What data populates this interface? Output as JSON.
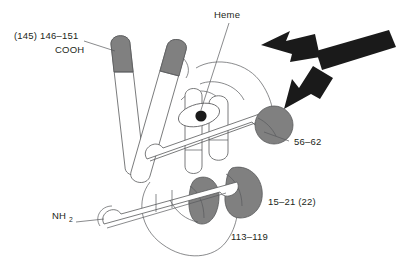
{
  "figure": {
    "kind": "protein-fold-schematic",
    "background_color": "#ffffff",
    "outline_color": "#58595b",
    "helix_fill_color": "#ffffff",
    "helix_cap_color": "#808080",
    "arrow_color": "#1a1a1a",
    "text_color": "#231f20"
  },
  "labels": {
    "cooh_range": "(145) 146–151",
    "cooh": "COOH",
    "heme": "Heme",
    "seg_56_62": "56–62",
    "seg_15_21": "15–21 (22)",
    "seg_113_119": "113–119",
    "nh2_main": "NH",
    "nh2_sub": "2"
  },
  "cropped_caption_fragments": [
    "n",
    "-",
    "-",
    "d"
  ]
}
